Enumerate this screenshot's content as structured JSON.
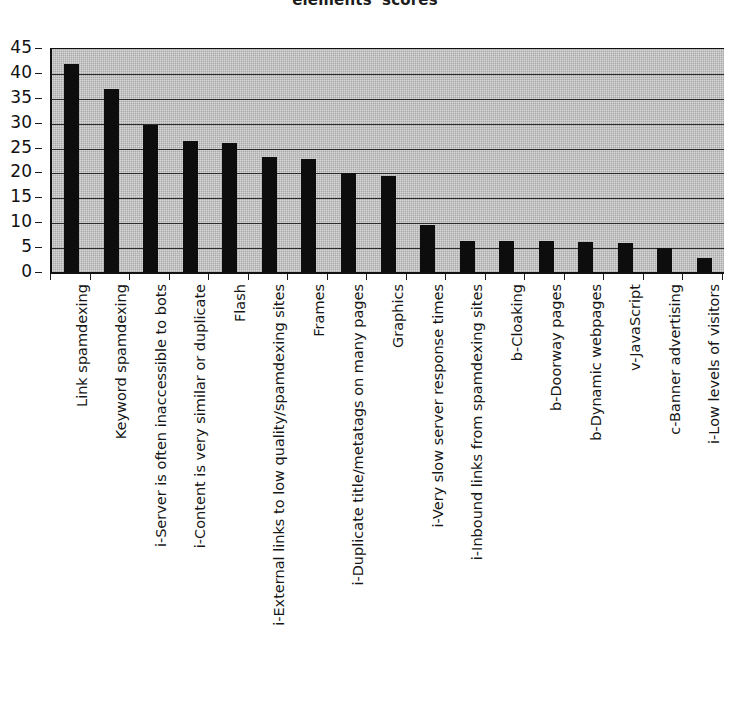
{
  "chart_data": {
    "type": "bar",
    "title": "elements' scores",
    "xlabel": "",
    "ylabel": "",
    "ylim": [
      0,
      45
    ],
    "ytick_step": 5,
    "yticks": [
      0,
      5,
      10,
      15,
      20,
      25,
      30,
      35,
      40,
      45
    ],
    "grid": true,
    "legend": false,
    "legend_position": "none",
    "orientation": "vertical",
    "bar_color": "#0d0d0d",
    "plot_background": "#a9a9a9",
    "categories": [
      "Link spamdexing",
      "Keyword spamdexing",
      "i-Server is often inaccessible to bots",
      "i-Content is very similar or duplicate",
      "Flash",
      "i-External links to low quality/spamdexing sites",
      "Frames",
      "i-Duplicate title/metatags on many pages",
      "Graphics",
      "i-Very slow server response times",
      "i-Inbound links from spamdexing sites",
      "b-Cloaking",
      "b-Doorway pages",
      "b-Dynamic webpages",
      "v-JavaScript",
      "c-Banner advertising",
      "i-Low levels of visitors"
    ],
    "values": [
      42,
      37,
      29.7,
      26.5,
      26.2,
      23.3,
      23,
      20,
      19.5,
      9.7,
      6.5,
      6.5,
      6.4,
      6.3,
      6,
      5,
      3
    ]
  }
}
